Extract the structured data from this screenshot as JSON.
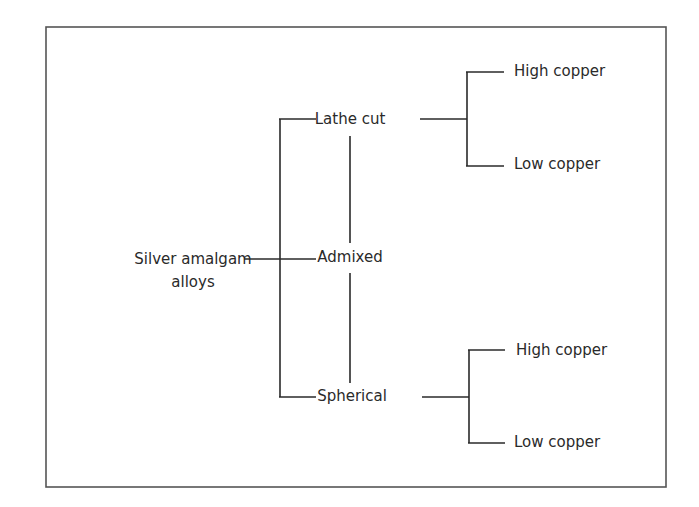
{
  "diagram": {
    "type": "classification-tree",
    "root": {
      "label_lines": [
        "Silver amalgam",
        "alloys"
      ]
    },
    "level1": [
      {
        "id": "lathe",
        "label": "Lathe cut"
      },
      {
        "id": "admixed",
        "label": "Admixed"
      },
      {
        "id": "spherical",
        "label": "Spherical"
      }
    ],
    "level2": {
      "lathe": [
        {
          "label": "High copper"
        },
        {
          "label": "Low copper"
        }
      ],
      "spherical": [
        {
          "label": "High copper"
        },
        {
          "label": "Low copper"
        }
      ]
    },
    "colors": {
      "line": "#2a2a2a",
      "frame": "#555555",
      "text": "#2a2a2a",
      "background": "#ffffff"
    }
  }
}
